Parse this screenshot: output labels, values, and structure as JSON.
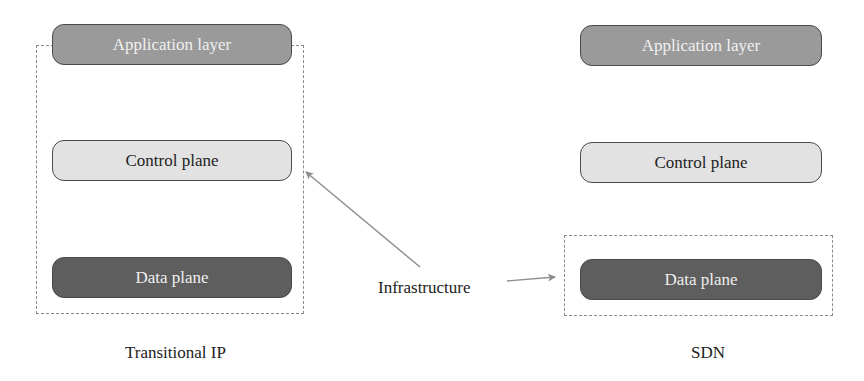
{
  "diagram": {
    "left": {
      "caption": "Transitional IP",
      "layers": {
        "application": "Application layer",
        "control": "Control plane",
        "data": "Data plane"
      },
      "infrastructure_box_covers": [
        "Application layer",
        "Control plane",
        "Data plane"
      ]
    },
    "right": {
      "caption": "SDN",
      "layers": {
        "application": "Application layer",
        "control": "Control plane",
        "data": "Data plane"
      },
      "infrastructure_box_covers": [
        "Data plane"
      ]
    },
    "annotation": {
      "label": "Infrastructure",
      "arrows_to": [
        "left infrastructure box",
        "right infrastructure box"
      ]
    },
    "colors": {
      "application_fill": "#9a9a9a",
      "control_fill": "#e2e2e2",
      "data_fill": "#5e5e5e",
      "border": "#4a4a4a",
      "dashed": "#8a8a8a",
      "arrow": "#8c8c8c"
    }
  }
}
